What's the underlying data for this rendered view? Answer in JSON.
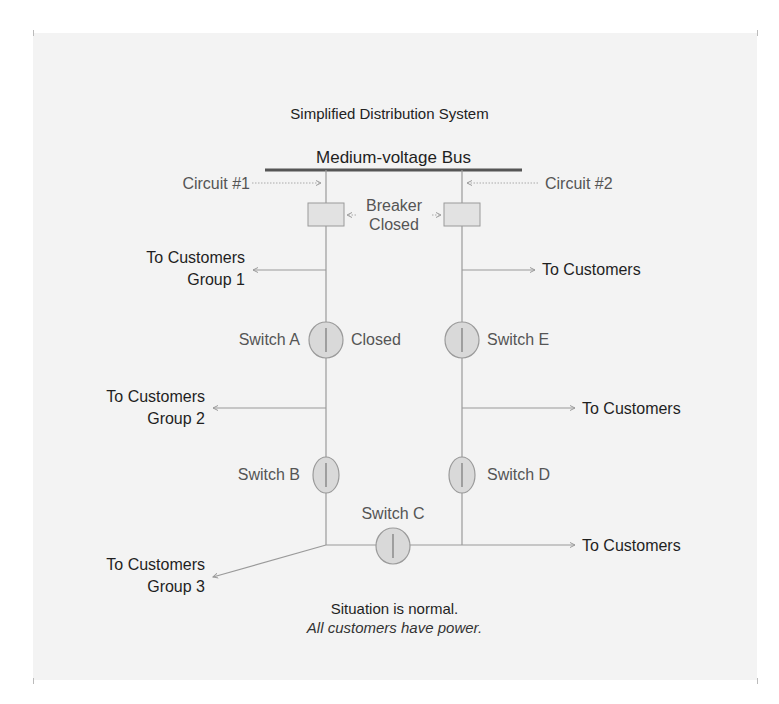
{
  "title": "Simplified Distribution System",
  "bus": {
    "label": "Medium-voltage Bus"
  },
  "circuits": [
    {
      "id": "circuit-1",
      "label": "Circuit #1"
    },
    {
      "id": "circuit-2",
      "label": "Circuit #2"
    }
  ],
  "breaker": {
    "line1": "Breaker",
    "line2": "Closed"
  },
  "switches": {
    "A": {
      "label": "Switch A",
      "state": "Closed"
    },
    "B": {
      "label": "Switch B"
    },
    "C": {
      "label": "Switch C"
    },
    "D": {
      "label": "Switch D"
    },
    "E": {
      "label": "Switch E"
    }
  },
  "customers": {
    "group1": {
      "line1": "To Customers",
      "line2": "Group 1"
    },
    "group2": {
      "line1": "To Customers",
      "line2": "Group 2"
    },
    "group3": {
      "line1": "To Customers",
      "line2": "Group 3"
    },
    "right1": "To Customers",
    "right2": "To Customers",
    "right3": "To Customers"
  },
  "status": {
    "headline": "Situation is normal.",
    "detail": "All customers have power."
  },
  "colors": {
    "background": "#f3f3f3",
    "line": "#9a9a9a",
    "bus": "#555555",
    "switch_fill": "#d9d9d9",
    "switch_stroke": "#9a9a9a",
    "breaker_fill": "#e2e2e2"
  }
}
